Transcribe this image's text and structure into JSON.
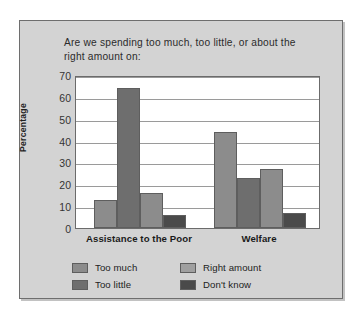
{
  "chart_data": {
    "type": "bar",
    "title": "Are we spending too much, too little, or about the right amount on:",
    "xlabel": "",
    "ylabel": "Percentage",
    "ylim": [
      0,
      70
    ],
    "ytick_step": 10,
    "yticks": [
      "70",
      "60",
      "50",
      "40",
      "30",
      "20",
      "10",
      "0"
    ],
    "grid": true,
    "legend_position": "bottom",
    "categories": [
      "Assistance to the Poor",
      "Welfare"
    ],
    "series": [
      {
        "name": "Too much",
        "values": [
          13,
          44
        ],
        "color": "#8c8c8c"
      },
      {
        "name": "Too little",
        "values": [
          64,
          23
        ],
        "color": "#6e6e6e"
      },
      {
        "name": "Right amount",
        "values": [
          16,
          27
        ],
        "color": "#8c8c8c"
      },
      {
        "name": "Don't know",
        "values": [
          6,
          7
        ],
        "color": "#4a4a4a"
      }
    ]
  },
  "panel": {
    "background_color": "#d3d3d3",
    "border_color": "#6e6e6e"
  },
  "legend": {
    "entries": [
      {
        "label": "Too much",
        "color": "#8c8c8c"
      },
      {
        "label": "Right amount",
        "color": "#a0a0a0"
      },
      {
        "label": "Too little",
        "color": "#6e6e6e"
      },
      {
        "label": "Don't know",
        "color": "#4a4a4a"
      }
    ]
  }
}
